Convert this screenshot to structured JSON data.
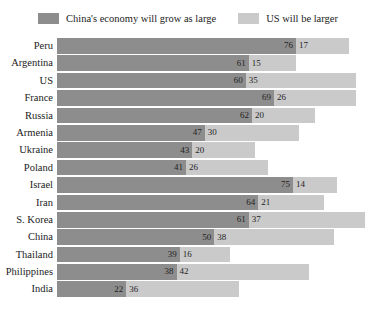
{
  "legend": {
    "entries": [
      {
        "label": "China's economy will grow as large",
        "color": "#8d8d8d",
        "swatch": "dark"
      },
      {
        "label": "US will be larger",
        "color": "#cacaca",
        "swatch": "light"
      }
    ]
  },
  "chart_data": {
    "type": "bar",
    "orientation": "horizontal",
    "stacked": true,
    "title": "",
    "subtitle": "",
    "xlabel": "",
    "ylabel": "",
    "grid": false,
    "legend_position": "top-center",
    "xlim": [
      0,
      100
    ],
    "categories": [
      "Peru",
      "Argentina",
      "US",
      "France",
      "Russia",
      "Armenia",
      "Ukraine",
      "Poland",
      "Israel",
      "Iran",
      "S. Korea",
      "China",
      "Thailand",
      "Philippines",
      "India"
    ],
    "series": [
      {
        "name": "China's economy will grow as large",
        "color": "#8d8d8d",
        "values": [
          76,
          61,
          60,
          69,
          62,
          47,
          43,
          41,
          75,
          64,
          61,
          50,
          39,
          38,
          22
        ]
      },
      {
        "name": "US will be larger",
        "color": "#cacaca",
        "values": [
          17,
          15,
          35,
          26,
          20,
          30,
          20,
          26,
          14,
          21,
          37,
          38,
          16,
          42,
          36
        ]
      }
    ],
    "rows": [
      {
        "label": "Peru",
        "china": 76,
        "us": 17
      },
      {
        "label": "Argentina",
        "china": 61,
        "us": 15
      },
      {
        "label": "US",
        "china": 60,
        "us": 35
      },
      {
        "label": "France",
        "china": 69,
        "us": 26
      },
      {
        "label": "Russia",
        "china": 62,
        "us": 20
      },
      {
        "label": "Armenia",
        "china": 47,
        "us": 30
      },
      {
        "label": "Ukraine",
        "china": 43,
        "us": 20
      },
      {
        "label": "Poland",
        "china": 41,
        "us": 26
      },
      {
        "label": "Israel",
        "china": 75,
        "us": 14
      },
      {
        "label": "Iran",
        "china": 64,
        "us": 21
      },
      {
        "label": "S. Korea",
        "china": 61,
        "us": 37
      },
      {
        "label": "China",
        "china": 50,
        "us": 38
      },
      {
        "label": "Thailand",
        "china": 39,
        "us": 16
      },
      {
        "label": "Philippines",
        "china": 38,
        "us": 42
      },
      {
        "label": "India",
        "china": 22,
        "us": 36
      }
    ]
  }
}
